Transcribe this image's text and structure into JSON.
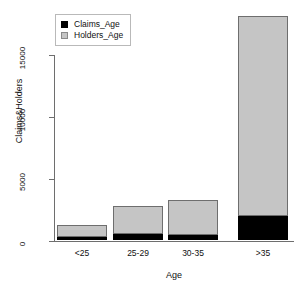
{
  "chart_data": {
    "type": "bar",
    "subtype": "stacked",
    "title": "",
    "xlabel": "Age",
    "ylabel": "Claims&Holders",
    "categories": [
      "<25",
      "25-29",
      "30-35",
      ">35"
    ],
    "series": [
      {
        "name": "Claims_Age",
        "color": "#000000",
        "values": [
          250,
          500,
          470,
          1950
        ]
      },
      {
        "name": "Holders_Age",
        "color": "#c5c5c5",
        "values": [
          990,
          2260,
          2780,
          16200
        ]
      }
    ],
    "totals": [
      1240,
      2760,
      3250,
      18150
    ],
    "ylim": [
      0,
      18600
    ],
    "yticks": [
      0,
      5000,
      10000,
      15000
    ],
    "ytick_labels": [
      "0",
      "5000",
      "10000",
      "15000"
    ],
    "grid": false,
    "legend": {
      "position": "top-left",
      "entries": [
        {
          "label": "Claims_Age",
          "swatch": "black-square"
        },
        {
          "label": "Holders_Age",
          "swatch": "grey-square"
        }
      ]
    },
    "axis_color": "#6e6e6e",
    "background": "#ffffff"
  }
}
